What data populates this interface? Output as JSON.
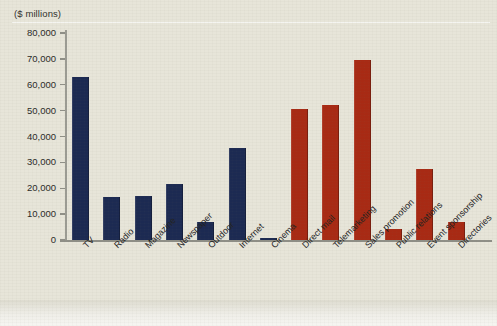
{
  "chart_data": {
    "type": "bar",
    "title": "",
    "subtitle": "",
    "unit_label": "($ millions)",
    "xlabel": "",
    "ylabel": "",
    "ylim": [
      0,
      80000
    ],
    "ytick_values": [
      0,
      10000,
      20000,
      30000,
      40000,
      50000,
      60000,
      70000,
      80000
    ],
    "ytick_labels": [
      "0",
      "10,000",
      "20,000",
      "30,000",
      "40,000",
      "50,000",
      "60,000",
      "70,000",
      "80,000"
    ],
    "grid": false,
    "legend": "none",
    "categories": [
      "TV",
      "Radio",
      "Magazine",
      "Newspaper",
      "Outdoor",
      "Internet",
      "Cinema",
      "Direct mail",
      "Telemarketing",
      "Sales promotion",
      "Public relations",
      "Event sponsorship",
      "Directories"
    ],
    "values": [
      63000,
      16500,
      17000,
      21500,
      7000,
      35500,
      800,
      50500,
      52000,
      69500,
      4200,
      27500,
      7000
    ],
    "bar_colors": [
      "#1c2a52",
      "#1c2a52",
      "#1c2a52",
      "#1c2a52",
      "#1c2a52",
      "#1c2a52",
      "#1c2a52",
      "#a82a14",
      "#a82a14",
      "#a82a14",
      "#a82a14",
      "#a82a14",
      "#a82a14"
    ],
    "groups": [
      {
        "name": "Advertising media",
        "color": "#1c2a52",
        "category_indices": [
          0,
          1,
          2,
          3,
          4,
          5,
          6
        ]
      },
      {
        "name": "Other promotion",
        "color": "#a82a14",
        "category_indices": [
          7,
          8,
          9,
          10,
          11,
          12
        ]
      }
    ]
  },
  "colors": {
    "navy": "#1c2a52",
    "red": "#a82a14",
    "plot_background": "#e7e5d9",
    "page_background": "#e4e2d6",
    "axis": "#8f8f87",
    "text": "#23231f"
  }
}
